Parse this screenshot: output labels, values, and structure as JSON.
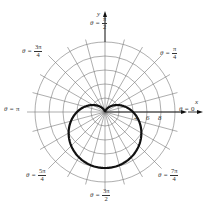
{
  "chart_data": {
    "type": "polar",
    "title": "",
    "equation_shape": "cardioid r = 4 - 4 sin(theta)",
    "xlabel": "x",
    "ylabel": "y",
    "pole_px": [
      105,
      112
    ],
    "px_per_unit": 7,
    "radial_grid": [
      2,
      4,
      6,
      8,
      10
    ],
    "angle_grid_step_deg": 15,
    "radial_ticks": [
      {
        "value": 4,
        "label": "4"
      },
      {
        "value": 6,
        "label": "6"
      },
      {
        "value": 8,
        "label": "8"
      }
    ],
    "angle_labels": [
      {
        "id": "a0",
        "prefix": "θ = ",
        "plain": "0"
      },
      {
        "id": "a45",
        "prefix": "θ = ",
        "num": "π",
        "den": "4"
      },
      {
        "id": "a90",
        "prefix": "θ = ",
        "num": "π",
        "den": "2"
      },
      {
        "id": "a135",
        "prefix": "θ = ",
        "num": "3π",
        "den": "4"
      },
      {
        "id": "a180",
        "prefix": "θ = ",
        "plain": "π"
      },
      {
        "id": "a225",
        "prefix": "θ = ",
        "num": "5π",
        "den": "4"
      },
      {
        "id": "a270",
        "prefix": "θ = ",
        "num": "3π",
        "den": "2"
      },
      {
        "id": "a315",
        "prefix": "θ = ",
        "num": "7π",
        "den": "4"
      }
    ],
    "series": [
      {
        "name": "cardioid",
        "theta_deg": [
          0,
          30,
          60,
          90,
          120,
          150,
          180,
          210,
          240,
          270,
          300,
          330,
          360
        ],
        "r": [
          4,
          2,
          0.54,
          0,
          0.54,
          2,
          4,
          6,
          7.46,
          8,
          7.46,
          6,
          4
        ]
      }
    ],
    "grid": true,
    "legend": null
  }
}
